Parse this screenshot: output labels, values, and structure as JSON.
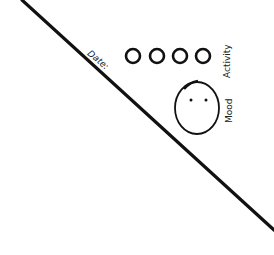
{
  "sketch": {
    "date_label": "Date:",
    "activity_label": "Activity",
    "mood_label": "Mood",
    "activity_circles": 4,
    "stroke_color": "#111111"
  }
}
